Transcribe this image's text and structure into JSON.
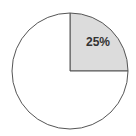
{
  "chart_data": {
    "type": "pie",
    "title": "",
    "slices": [
      {
        "label": "25%",
        "value": 25,
        "color": "#dcdcdc",
        "show_label": true
      },
      {
        "label": "",
        "value": 75,
        "color": "#ffffff",
        "show_label": false
      }
    ],
    "start_angle_deg": 0,
    "direction": "clockwise-from-top",
    "stroke_color": "#555555",
    "legend": "none"
  }
}
